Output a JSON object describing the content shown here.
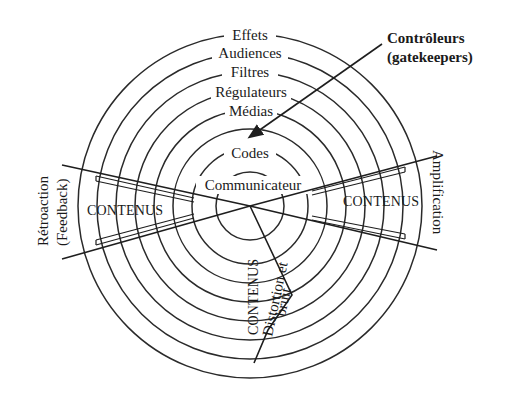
{
  "diagram": {
    "center": {
      "x": 250,
      "y": 206
    },
    "rings": [
      {
        "label": "Effets",
        "radius": 172
      },
      {
        "label": "Audiences",
        "radius": 153
      },
      {
        "label": "Filtres",
        "radius": 134
      },
      {
        "label": "Régulateurs",
        "radius": 115
      },
      {
        "label": "Médias",
        "radius": 96
      },
      {
        "label": "",
        "radius": 77
      },
      {
        "label": "Codes",
        "radius": 58
      },
      {
        "label": "Communicateur",
        "radius": 34
      }
    ],
    "labels": {
      "effets": "Effets",
      "audiences": "Audiences",
      "filtres": "Filtres",
      "regulateurs": "Régulateurs",
      "medias": "Médias",
      "codes": "Codes",
      "communicateur": "Communicateur",
      "controleurs_line1": "Contrôleurs",
      "controleurs_line2": "(gatekeepers)",
      "contenus_left": "CONTENUS",
      "contenus_right": "CONTENUS",
      "contenus_bottom": "CONTENUS",
      "distortion_line1": "Distortion et",
      "distortion_line2": "bruit",
      "retroaction": "Rétroaction",
      "feedback": "(Feedback)",
      "amplification": "Amplification"
    },
    "colors": {
      "line": "#1e1e1e",
      "text": "#1a1a1a",
      "background": "#ffffff"
    }
  }
}
